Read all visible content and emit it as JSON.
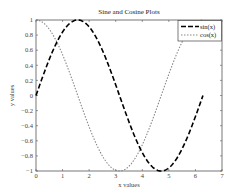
{
  "chart_data": {
    "type": "line",
    "title": "Sine and Cosine Plots",
    "xlabel": "x values",
    "ylabel": "y values",
    "xlim": [
      0,
      7
    ],
    "ylim": [
      -1,
      1
    ],
    "x_ticks": [
      "0",
      "1",
      "2",
      "3",
      "4",
      "5",
      "6",
      "7"
    ],
    "y_ticks": [
      "-1",
      "-0.8",
      "-0.6",
      "-0.4",
      "-0.2",
      "0",
      "0.2",
      "0.4",
      "0.6",
      "0.8",
      "1"
    ],
    "grid": false,
    "legend_position": "upper right",
    "x": [
      0,
      0.314,
      0.628,
      0.942,
      1.257,
      1.571,
      1.885,
      2.199,
      2.513,
      2.827,
      3.142,
      3.456,
      3.77,
      4.084,
      4.398,
      4.712,
      5.027,
      5.341,
      5.655,
      5.969,
      6.283
    ],
    "series": [
      {
        "name": "sin(x)",
        "style": "dashed",
        "color": "#000000",
        "values": [
          0,
          0.309,
          0.588,
          0.809,
          0.951,
          1.0,
          0.951,
          0.809,
          0.588,
          0.309,
          0,
          -0.309,
          -0.588,
          -0.809,
          -0.951,
          -1.0,
          -0.951,
          -0.809,
          -0.588,
          -0.309,
          0
        ]
      },
      {
        "name": "cos(x)",
        "style": "dotted",
        "color": "#888888",
        "values": [
          1.0,
          0.951,
          0.809,
          0.588,
          0.309,
          0,
          -0.309,
          -0.588,
          -0.809,
          -0.951,
          -1.0,
          -0.951,
          -0.809,
          -0.588,
          -0.309,
          0,
          0.309,
          0.588,
          0.809,
          0.951,
          1.0
        ]
      }
    ]
  }
}
